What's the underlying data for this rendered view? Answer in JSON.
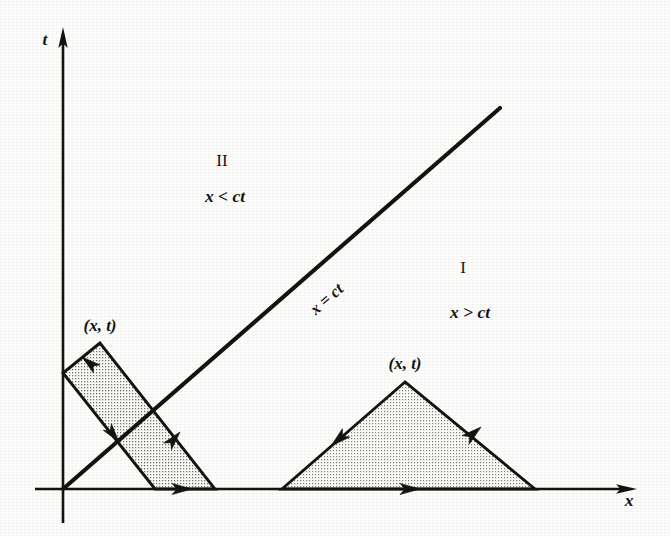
{
  "figure": {
    "background_color": "#fdfdfc",
    "ink_color": "#14130f",
    "shade_color": "#d9d9d4"
  },
  "axes": {
    "t_axis_label": "t",
    "x_axis_label": "x",
    "origin": {
      "x": 63,
      "y": 489
    },
    "t_axis": {
      "x": 63,
      "top_y": 30,
      "bottom_y": 523
    },
    "x_axis": {
      "y": 489,
      "left_x": 35,
      "right_x": 635
    }
  },
  "characteristic": {
    "label": "x = ct",
    "from": {
      "x": 63,
      "y": 489
    },
    "to": {
      "x": 500,
      "y": 108
    },
    "label_position": {
      "x": 330,
      "y": 303
    },
    "label_rotation_deg": -41
  },
  "regions": [
    {
      "id": "region-one",
      "numeral": "I",
      "condition": "x > ct",
      "numeral_position": {
        "x": 463,
        "y": 268
      },
      "condition_position": {
        "x": 470,
        "y": 313
      }
    },
    {
      "id": "region-two",
      "numeral": "II",
      "condition": "x < ct",
      "numeral_position": {
        "x": 222,
        "y": 161
      },
      "condition_position": {
        "x": 225,
        "y": 197
      }
    }
  ],
  "shaded_shapes": [
    {
      "id": "reflected-domain",
      "kind": "parallelogram",
      "apex_label": "(x, t)",
      "apex_label_position": {
        "x": 100,
        "y": 326
      },
      "vertices": [
        {
          "x": 100,
          "y": 343
        },
        {
          "x": 63,
          "y": 373
        },
        {
          "x": 155,
          "y": 489
        },
        {
          "x": 215,
          "y": 489
        }
      ],
      "edge_arrows": [
        {
          "at": {
            "x": 80,
            "y": 359
          },
          "direction_deg": 219
        },
        {
          "at": {
            "x": 110,
            "y": 432
          },
          "direction_deg": 51
        },
        {
          "at": {
            "x": 186,
            "y": 489
          },
          "direction_deg": 0
        },
        {
          "at": {
            "x": 174,
            "y": 438
          },
          "direction_deg": 232
        }
      ]
    },
    {
      "id": "interior-domain",
      "kind": "triangle",
      "apex_label": "(x, t)",
      "apex_label_position": {
        "x": 405,
        "y": 364
      },
      "vertices": [
        {
          "x": 405,
          "y": 382
        },
        {
          "x": 282,
          "y": 489
        },
        {
          "x": 535,
          "y": 489
        }
      ],
      "edge_arrows": [
        {
          "at": {
            "x": 341,
            "y": 437
          },
          "direction_deg": 139
        },
        {
          "at": {
            "x": 470,
            "y": 437
          },
          "direction_deg": 221
        },
        {
          "at": {
            "x": 410,
            "y": 489
          },
          "direction_deg": 0
        }
      ]
    }
  ]
}
